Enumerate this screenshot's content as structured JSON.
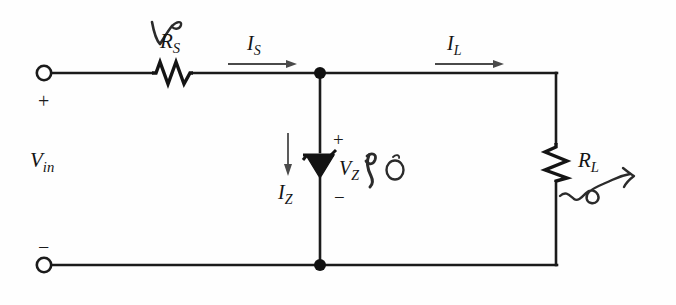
{
  "figure": {
    "type": "circuit-schematic",
    "background_color": "#fefefe",
    "ink_color": "#141414"
  },
  "labels": {
    "source_voltage": {
      "text": "V",
      "sub": "in"
    },
    "series_resistor": {
      "text": "R",
      "sub": "S"
    },
    "load_resistor": {
      "text": "R",
      "sub": "L"
    },
    "zener_voltage": {
      "text": "V",
      "sub": "Z"
    },
    "source_current": {
      "text": "I",
      "sub": "S"
    },
    "load_current": {
      "text": "I",
      "sub": "L"
    },
    "zener_current": {
      "text": "I",
      "sub": "Z"
    }
  },
  "polarity": {
    "input_plus": "+",
    "input_minus": "−",
    "zener_plus": "+",
    "zener_minus": "−"
  },
  "components": {
    "terminal_top": "input-terminal-positive",
    "terminal_bottom": "input-terminal-negative",
    "resistor_series": "resistor-rs",
    "resistor_load": "resistor-rl",
    "diode": "zener-diode",
    "node_top": "junction-node-top",
    "node_bottom": "junction-node-bottom"
  },
  "annotations": {
    "mark_above_rs": "handwritten-check-mark",
    "mark_near_vz": "handwritten-scribble",
    "mark_circle_near_vz": "handwritten-circle",
    "mark_near_rl": "handwritten-squiggle-arrow"
  }
}
